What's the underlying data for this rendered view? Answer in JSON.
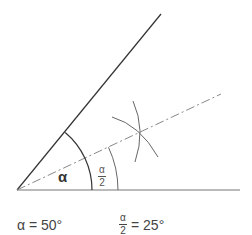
{
  "diagram": {
    "angle_label": "α",
    "half_angle": {
      "numerator": "α",
      "denominator": "2"
    },
    "legend": {
      "alpha_value": "α = 50°",
      "half_numerator": "α",
      "half_denominator": "2",
      "half_value": "= 25°"
    },
    "geometry": {
      "vertex": [
        17,
        190
      ],
      "upper_ray_end": [
        161,
        14
      ],
      "baseline_end": [
        240,
        190
      ],
      "bisector_end": [
        221,
        94
      ],
      "alpha_arc_radius": 75,
      "half_arc_radius": 101,
      "construction_intersection": [
        140,
        132
      ]
    },
    "colors": {
      "line": "#333333",
      "baseline": "#777777",
      "bisector": "#888888",
      "arc": "#555555"
    }
  }
}
